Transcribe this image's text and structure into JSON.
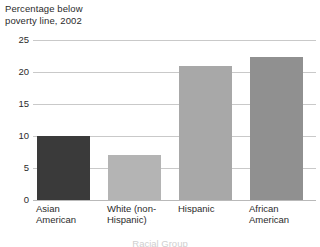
{
  "chart_data": {
    "type": "bar",
    "title": "Percentage below\npoverty line, 2002",
    "xlabel": "Racial Group",
    "ylabel": "",
    "categories": [
      "Asian\nAmerican",
      "White (non-\nHispanic)",
      "Hispanic",
      "African\nAmerican"
    ],
    "values": [
      10,
      7,
      21,
      22.3
    ],
    "ylim": [
      0,
      25
    ],
    "yticks": [
      "0",
      "5",
      "10",
      "15",
      "20",
      "25"
    ],
    "ytick_values": [
      0,
      5,
      10,
      15,
      20,
      25
    ],
    "grid": true,
    "legend": false,
    "bar_colors": [
      "#3a3a3a",
      "#b4b4b4",
      "#a8a8a8",
      "#909090"
    ]
  },
  "axes": {
    "gridline_color": "#c9c9c9",
    "baseline_color": "#b9b9b9"
  }
}
